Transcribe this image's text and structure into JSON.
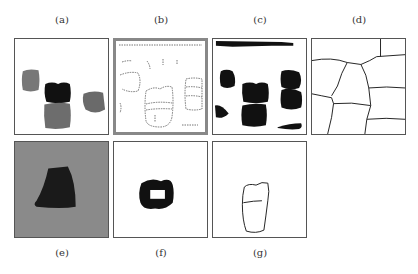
{
  "figure": {
    "panels": [
      {
        "id": "a",
        "label": "(a)",
        "description": "input image with gray blob regions"
      },
      {
        "id": "b",
        "label": "(b)",
        "description": "dotted edge map"
      },
      {
        "id": "c",
        "label": "(c)",
        "description": "binary segmented blobs"
      },
      {
        "id": "d",
        "label": "(d)",
        "description": "region boundary partition"
      },
      {
        "id": "e",
        "label": "(e)",
        "description": "dark region on gray textured background"
      },
      {
        "id": "f",
        "label": "(f)",
        "description": "ring-shaped black region"
      },
      {
        "id": "g",
        "label": "(g)",
        "description": "single object outline"
      }
    ],
    "colors": {
      "border": "#555555",
      "gray_blob": "#777777",
      "black_blob": "#111111",
      "gray_background": "#8a8a8a"
    }
  }
}
